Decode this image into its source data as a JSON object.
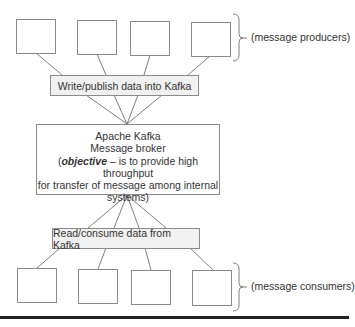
{
  "producers": {
    "label": "(message producers)",
    "count": 4
  },
  "write_bar": {
    "label": "Write/publish data into Kafka"
  },
  "broker": {
    "title": "Apache Kafka",
    "subtitle": "Message broker",
    "objective_open": "(",
    "objective_keyword": "objective",
    "objective_rest_line1": " – is to provide high throughput",
    "objective_line2": "for transfer of message among internal",
    "objective_line3": "systems)"
  },
  "read_bar": {
    "label": "Read/consume data from Kafka"
  },
  "consumers": {
    "label": "(message consumers)",
    "count": 4
  },
  "colors": {
    "border": "#8a8a8a",
    "bar_fill": "#f1f1f1",
    "rule": "#222222"
  }
}
